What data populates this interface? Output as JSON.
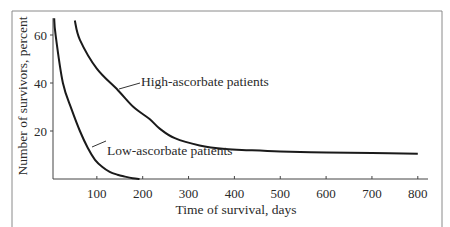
{
  "chart_data": {
    "type": "line",
    "title": "",
    "xlabel": "Time of survival, days",
    "ylabel": "Number of survivors, percent",
    "xlim": [
      5,
      820
    ],
    "ylim": [
      0,
      67
    ],
    "x_ticks": [
      100,
      200,
      300,
      400,
      500,
      600,
      700,
      800
    ],
    "y_ticks": [
      20,
      40,
      60
    ],
    "grid": false,
    "legend": "none (inline annotations)",
    "series": [
      {
        "name": "High-ascorbate patients",
        "x": [
          52,
          63,
          100,
          146,
          180,
          215,
          237,
          270,
          324,
          380,
          433,
          500,
          600,
          700,
          800
        ],
        "y": [
          66,
          58,
          46,
          37,
          30,
          25,
          21,
          17,
          14,
          12.5,
          12,
          11.5,
          11,
          10.8,
          10.5
        ]
      },
      {
        "name": "Low-ascorbate patients",
        "x": [
          7,
          10,
          26,
          45,
          63,
          80,
          96,
          112,
          128,
          145,
          161,
          178,
          193
        ],
        "y": [
          67,
          60,
          40,
          29,
          20,
          13,
          8,
          5,
          3,
          1.8,
          1,
          0.3,
          0
        ]
      }
    ],
    "annotations": [
      {
        "text": "High-ascorbate patients",
        "series": "High-ascorbate patients"
      },
      {
        "text": "Low-ascorbate patients",
        "series": "Low-ascorbate patients"
      }
    ]
  }
}
